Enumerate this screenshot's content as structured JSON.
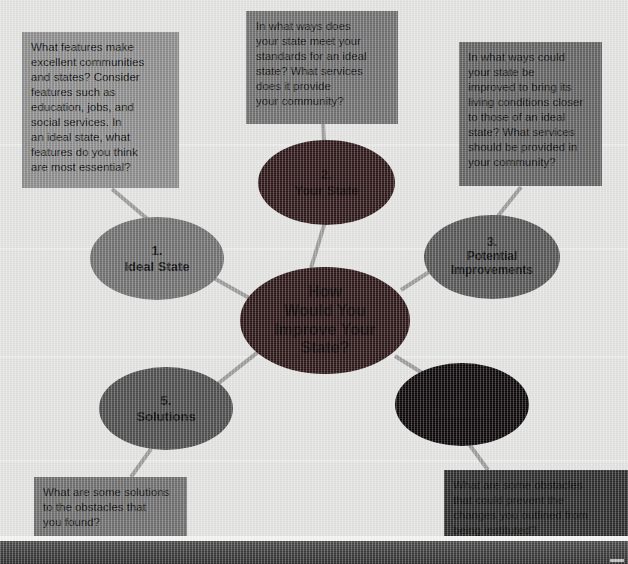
{
  "diagram": {
    "title": "How Would You Improve Your State?",
    "type": "concept-web",
    "background_color": "#e3e3e2",
    "connector_color": "#9a9a9a",
    "center": {
      "id": "center",
      "label": "How\nWould You\nImprove Your\nState?",
      "fill": "#2a1415",
      "text_color": "#0d0506",
      "x": 240,
      "y": 267,
      "w": 170,
      "h": 107,
      "font_size": 16
    },
    "nodes": [
      {
        "id": "node-1",
        "number": "1.",
        "label": "Ideal State",
        "full_label": "1.\nIdeal State",
        "fill": "#6f6f6f",
        "text_color": "#101010",
        "x": 90,
        "y": 217,
        "w": 134,
        "h": 83,
        "font_size": 13
      },
      {
        "id": "node-2",
        "number": "2.",
        "label": "Your State",
        "full_label": "2.\nYour State",
        "fill": "#2c1516",
        "text_color": "#0c0405",
        "x": 258,
        "y": 140,
        "w": 137,
        "h": 85,
        "font_size": 13
      },
      {
        "id": "node-3",
        "number": "3.",
        "label": "Potential\nImprovements",
        "full_label": "3.\nPotential\nImprovements",
        "fill": "#545454",
        "text_color": "#0d0d0d",
        "x": 424,
        "y": 215,
        "w": 136,
        "h": 84,
        "font_size": 12
      },
      {
        "id": "node-4",
        "number": "4.",
        "label": "Obstacles",
        "full_label": "4.\nObstacles",
        "fill": "#0a0506",
        "text_color": "#120a0b",
        "x": 395,
        "y": 363,
        "w": 134,
        "h": 83,
        "font_size": 13
      },
      {
        "id": "node-5",
        "number": "5.",
        "label": "Solutions",
        "full_label": "5.\nSolutions",
        "fill": "#4c4c4c",
        "text_color": "#0d0d0d",
        "x": 99,
        "y": 367,
        "w": 134,
        "h": 83,
        "font_size": 13
      }
    ],
    "callouts": [
      {
        "id": "callout-1",
        "for": "node-1",
        "text": "What features make\nexcellent communities\nand states? Consider\nfeatures such as\neducation, jobs, and\nsocial services. In\nan ideal state, what\nfeatures do you think\nare most essential?",
        "fill": "#8b8b8b",
        "text_color": "#111111",
        "x": 22,
        "y": 32,
        "w": 157,
        "h": 156,
        "font_size": 11.5,
        "pad_left": 9,
        "pad_top": 8
      },
      {
        "id": "callout-2",
        "for": "node-2",
        "text": "In what ways does\nyour state meet your\nstandards for an ideal\nstate? What services\ndoes it provide\nyour community?",
        "fill": "#6e6e6e",
        "text_color": "#101010",
        "x": 246,
        "y": 11,
        "w": 152,
        "h": 113,
        "font_size": 11.5,
        "pad_left": 10,
        "pad_top": 8
      },
      {
        "id": "callout-3",
        "for": "node-3",
        "text": "In what ways could\nyour state be\nimproved to bring its\nliving conditions closer\nto those of an ideal\nstate? What services\nshould be provided in\nyour community?",
        "fill": "#616161",
        "text_color": "#0f0f0f",
        "x": 459,
        "y": 42,
        "w": 143,
        "h": 144,
        "font_size": 11.5,
        "pad_left": 9,
        "pad_top": 8
      },
      {
        "id": "callout-4",
        "for": "node-4",
        "text": "What are some obstacles\nthat could prevent the\nchanges you outlined from\nbeing instituted?",
        "fill": "#2b2b2b",
        "text_color": "#0a0a0a",
        "x": 444,
        "y": 470,
        "w": 184,
        "h": 74,
        "font_size": 11.5,
        "pad_left": 9,
        "pad_top": 8
      },
      {
        "id": "callout-5",
        "for": "node-5",
        "text": "What are some solutions\nto the obstacles that\nyou found?",
        "fill": "#6d6d6d",
        "text_color": "#101010",
        "x": 34,
        "y": 477,
        "w": 153,
        "h": 59,
        "font_size": 11.5,
        "pad_left": 9,
        "pad_top": 8
      }
    ],
    "connectors": [
      {
        "id": "edge-center-1",
        "from": "center",
        "to": "node-1",
        "x1": 251,
        "y1": 299,
        "x2": 203,
        "y2": 272
      },
      {
        "id": "edge-center-2",
        "from": "center",
        "to": "node-2",
        "x1": 311,
        "y1": 268,
        "x2": 325,
        "y2": 222
      },
      {
        "id": "edge-center-3",
        "from": "center",
        "to": "node-3",
        "x1": 401,
        "y1": 290,
        "x2": 451,
        "y2": 258
      },
      {
        "id": "edge-center-4",
        "from": "center",
        "to": "node-4",
        "x1": 395,
        "y1": 356,
        "x2": 432,
        "y2": 379
      },
      {
        "id": "edge-center-5",
        "from": "center",
        "to": "node-5",
        "x1": 258,
        "y1": 352,
        "x2": 215,
        "y2": 386
      },
      {
        "id": "edge-1-callout",
        "from": "node-1",
        "to": "callout-1",
        "x1": 151,
        "y1": 222,
        "x2": 112,
        "y2": 189
      },
      {
        "id": "edge-2-callout",
        "from": "node-2",
        "to": "callout-2",
        "x1": 324,
        "y1": 141,
        "x2": 323,
        "y2": 124
      },
      {
        "id": "edge-3-callout",
        "from": "node-3",
        "to": "callout-3",
        "x1": 498,
        "y1": 216,
        "x2": 521,
        "y2": 187
      },
      {
        "id": "edge-4-callout",
        "from": "node-4",
        "to": "callout-4",
        "x1": 469,
        "y1": 444,
        "x2": 488,
        "y2": 470
      },
      {
        "id": "edge-5-callout",
        "from": "node-5",
        "to": "callout-5",
        "x1": 151,
        "y1": 449,
        "x2": 131,
        "y2": 477
      }
    ]
  }
}
